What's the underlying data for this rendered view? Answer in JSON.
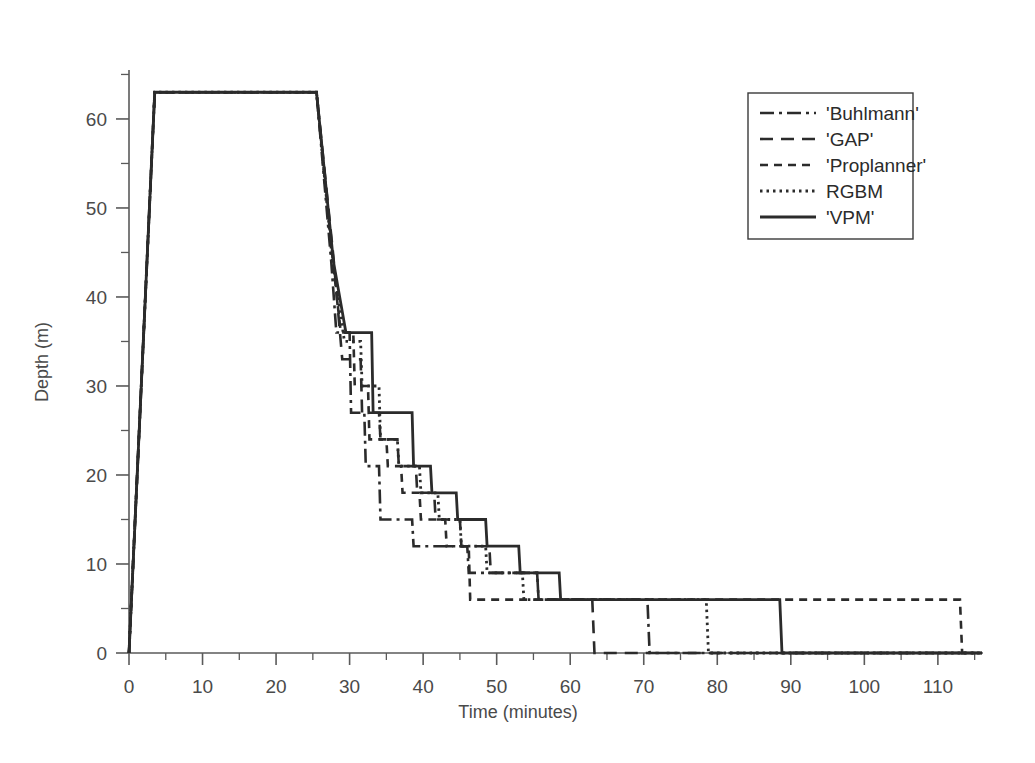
{
  "chart_data": {
    "type": "line",
    "title": "",
    "xlabel": "Time (minutes)",
    "ylabel": "Depth (m)",
    "xlim": [
      0,
      116
    ],
    "ylim": [
      0,
      65.5
    ],
    "grid": false,
    "legend_position": "top-right",
    "x_ticks": [
      0,
      10,
      20,
      30,
      40,
      50,
      60,
      70,
      80,
      90,
      100,
      110
    ],
    "x_minor_ticks": [
      5,
      15,
      25,
      35,
      45,
      55,
      65,
      75,
      85,
      95,
      105,
      115
    ],
    "y_ticks": [
      0,
      10,
      20,
      30,
      40,
      50,
      60
    ],
    "y_minor_ticks": [
      5,
      15,
      25,
      35,
      45,
      55,
      65
    ],
    "x_tick_labels": [
      "0",
      "10",
      "20",
      "30",
      "40",
      "50",
      "60",
      "70",
      "80",
      "90",
      "100",
      "110"
    ],
    "y_tick_labels": [
      "0",
      "10",
      "20",
      "30",
      "40",
      "50",
      "60"
    ],
    "line_color": "#2b2b2b",
    "series": [
      {
        "name": "'Buhlmann'",
        "legend_label": "'Buhlmann'",
        "dash": "14,5,3,5",
        "width": 2.6,
        "points": [
          [
            0,
            0
          ],
          [
            3.5,
            63
          ],
          [
            25.5,
            63
          ],
          [
            27.5,
            44
          ],
          [
            28.2,
            36
          ],
          [
            30.0,
            36
          ],
          [
            30.2,
            27
          ],
          [
            32.0,
            27
          ],
          [
            32.2,
            21
          ],
          [
            34.0,
            21
          ],
          [
            34.2,
            15
          ],
          [
            38.5,
            15
          ],
          [
            38.7,
            12
          ],
          [
            46.0,
            12
          ],
          [
            46.2,
            9
          ],
          [
            55.5,
            9
          ],
          [
            55.7,
            6
          ],
          [
            70.5,
            6
          ],
          [
            70.8,
            0
          ],
          [
            116,
            0
          ]
        ]
      },
      {
        "name": "'GAP'",
        "legend_label": "'GAP'",
        "dash": "13,8",
        "width": 2.6,
        "points": [
          [
            0,
            0
          ],
          [
            3.5,
            63
          ],
          [
            25.5,
            63
          ],
          [
            27.8,
            44.5
          ],
          [
            29.0,
            33
          ],
          [
            31.5,
            33
          ],
          [
            31.7,
            27
          ],
          [
            34.0,
            27
          ],
          [
            34.2,
            24
          ],
          [
            36.5,
            24
          ],
          [
            36.7,
            21
          ],
          [
            39.0,
            21
          ],
          [
            39.2,
            18
          ],
          [
            41.5,
            18
          ],
          [
            41.7,
            15
          ],
          [
            45.0,
            15
          ],
          [
            45.2,
            12
          ],
          [
            49.0,
            12
          ],
          [
            49.2,
            9
          ],
          [
            55.5,
            9
          ],
          [
            55.7,
            6
          ],
          [
            63.0,
            6
          ],
          [
            63.3,
            0
          ],
          [
            116,
            0
          ]
        ]
      },
      {
        "name": "'Proplanner'",
        "legend_label": "'Proplanner'",
        "dash": "8,6",
        "width": 2.6,
        "points": [
          [
            0,
            0
          ],
          [
            3.5,
            63
          ],
          [
            25.5,
            63
          ],
          [
            27.6,
            45
          ],
          [
            28.8,
            36
          ],
          [
            30.5,
            36
          ],
          [
            30.7,
            30
          ],
          [
            32.5,
            30
          ],
          [
            32.7,
            24
          ],
          [
            35.0,
            24
          ],
          [
            35.2,
            21
          ],
          [
            37.0,
            21
          ],
          [
            37.2,
            18
          ],
          [
            39.5,
            18
          ],
          [
            39.7,
            15
          ],
          [
            43.0,
            15
          ],
          [
            43.2,
            12
          ],
          [
            46.2,
            12
          ],
          [
            46.4,
            6
          ],
          [
            113.0,
            6
          ],
          [
            113.3,
            0
          ],
          [
            116,
            0
          ]
        ]
      },
      {
        "name": "RGBM",
        "legend_label": "RGBM",
        "dash": "2.5,4",
        "width": 2.8,
        "points": [
          [
            0,
            0
          ],
          [
            3.5,
            63
          ],
          [
            25.5,
            63
          ],
          [
            27.6,
            44.5
          ],
          [
            29.3,
            35
          ],
          [
            31.5,
            35
          ],
          [
            31.7,
            30
          ],
          [
            34.0,
            30
          ],
          [
            34.2,
            24
          ],
          [
            36.5,
            24
          ],
          [
            36.7,
            21
          ],
          [
            39.5,
            21
          ],
          [
            39.7,
            18
          ],
          [
            42.0,
            18
          ],
          [
            42.2,
            15
          ],
          [
            45.0,
            15
          ],
          [
            45.2,
            12
          ],
          [
            48.5,
            12
          ],
          [
            48.7,
            9
          ],
          [
            53.5,
            9
          ],
          [
            53.7,
            6
          ],
          [
            78.5,
            6
          ],
          [
            78.8,
            0
          ],
          [
            116,
            0
          ]
        ]
      },
      {
        "name": "'VPM'",
        "legend_label": "'VPM'",
        "dash": "",
        "width": 2.8,
        "points": [
          [
            0,
            0
          ],
          [
            3.5,
            63
          ],
          [
            25.5,
            63
          ],
          [
            27.8,
            44
          ],
          [
            29.5,
            36
          ],
          [
            33.0,
            36
          ],
          [
            33.2,
            27
          ],
          [
            38.5,
            27
          ],
          [
            38.7,
            21
          ],
          [
            41.0,
            21
          ],
          [
            41.2,
            18
          ],
          [
            44.5,
            18
          ],
          [
            44.7,
            15
          ],
          [
            48.5,
            15
          ],
          [
            48.7,
            12
          ],
          [
            53.0,
            12
          ],
          [
            53.2,
            9
          ],
          [
            58.5,
            9
          ],
          [
            58.7,
            6
          ],
          [
            88.5,
            6
          ],
          [
            88.8,
            0
          ],
          [
            116,
            0
          ]
        ]
      }
    ]
  }
}
